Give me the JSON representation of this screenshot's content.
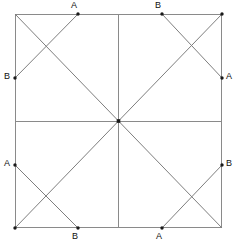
{
  "figure": {
    "name": "square-pinwheel-diagram",
    "type": "geometry-diagram",
    "canvas": {
      "width": 237,
      "height": 244
    },
    "square": {
      "left": 15,
      "top": 14,
      "right": 222,
      "bottom": 228,
      "width": 207,
      "height": 214,
      "stroke_color": "#8a8a8a"
    },
    "center": {
      "x": 118.5,
      "y": 121,
      "label": ""
    },
    "colors": {
      "background": "#ffffff",
      "square_stroke": "#8a8a8a",
      "median_stroke": "#8a8a8a",
      "diagonal_stroke": "#7e7e7e",
      "cross_stroke": "#7e7e7e",
      "dot_fill": "#1a1a1a",
      "label_text": "#101010"
    },
    "corners": [
      {
        "name": "top-left",
        "x": 15,
        "y": 14
      },
      {
        "name": "top-right",
        "x": 222,
        "y": 14
      },
      {
        "name": "bottom-right",
        "x": 222,
        "y": 228
      },
      {
        "name": "bottom-left",
        "x": 15,
        "y": 228
      }
    ],
    "medians": [
      {
        "name": "horizontal-median",
        "x1": 15,
        "y1": 121,
        "x2": 222,
        "y2": 121
      },
      {
        "name": "vertical-median",
        "x1": 118.5,
        "y1": 14,
        "x2": 118.5,
        "y2": 228
      }
    ],
    "diagonals": [
      {
        "name": "diagonal-center-to-top-left",
        "x1": 118.5,
        "y1": 121,
        "x2": 15,
        "y2": 14
      },
      {
        "name": "diagonal-center-to-top-right",
        "x1": 118.5,
        "y1": 121,
        "x2": 222,
        "y2": 14
      },
      {
        "name": "diagonal-center-to-bottom-right",
        "x1": 118.5,
        "y1": 121,
        "x2": 222,
        "y2": 228
      },
      {
        "name": "diagonal-center-to-bottom-left",
        "x1": 118.5,
        "y1": 121,
        "x2": 15,
        "y2": 228
      }
    ],
    "cross_segments": [
      {
        "name": "cross-top-left",
        "from": "top-A",
        "to": "left-B",
        "x1": 78,
        "y1": 14,
        "x2": 15,
        "y2": 78
      },
      {
        "name": "cross-top-right",
        "from": "top-B",
        "to": "right-A",
        "x1": 162,
        "y1": 14,
        "x2": 222,
        "y2": 78
      },
      {
        "name": "cross-bottom-left",
        "from": "left-A",
        "to": "bottom-B",
        "x1": 15,
        "y1": 165,
        "x2": 78,
        "y2": 228
      },
      {
        "name": "cross-bottom-right",
        "from": "right-B",
        "to": "bottom-A",
        "x1": 222,
        "y1": 165,
        "x2": 162,
        "y2": 228
      }
    ],
    "points": [
      {
        "id": "top-A",
        "label": "A",
        "x": 78,
        "y": 14,
        "label_x": 71,
        "label_y": 1,
        "edge": "top"
      },
      {
        "id": "top-B",
        "label": "B",
        "x": 162,
        "y": 14,
        "label_x": 155,
        "label_y": 1,
        "edge": "top"
      },
      {
        "id": "left-B",
        "label": "B",
        "x": 15,
        "y": 78,
        "label_x": 4,
        "label_y": 72,
        "edge": "left"
      },
      {
        "id": "right-A",
        "label": "A",
        "x": 222,
        "y": 78,
        "label_x": 226,
        "label_y": 72,
        "edge": "right"
      },
      {
        "id": "left-A",
        "label": "A",
        "x": 15,
        "y": 165,
        "label_x": 4,
        "label_y": 159,
        "edge": "left"
      },
      {
        "id": "right-B",
        "label": "B",
        "x": 222,
        "y": 165,
        "label_x": 226,
        "label_y": 159,
        "edge": "right"
      },
      {
        "id": "bottom-B",
        "label": "B",
        "x": 78,
        "y": 228,
        "label_x": 72,
        "label_y": 232,
        "edge": "bottom"
      },
      {
        "id": "bottom-A",
        "label": "A",
        "x": 162,
        "y": 228,
        "label_x": 156,
        "label_y": 232,
        "edge": "bottom"
      }
    ],
    "dots": [
      {
        "name": "dot-top-A",
        "x": 78,
        "y": 14,
        "r": 1.7
      },
      {
        "name": "dot-top-B",
        "x": 162,
        "y": 14,
        "r": 1.7
      },
      {
        "name": "dot-left-B",
        "x": 15,
        "y": 78,
        "r": 1.7
      },
      {
        "name": "dot-right-A",
        "x": 222,
        "y": 78,
        "r": 1.7
      },
      {
        "name": "dot-left-A",
        "x": 15,
        "y": 165,
        "r": 1.7
      },
      {
        "name": "dot-right-B",
        "x": 222,
        "y": 165,
        "r": 1.7
      },
      {
        "name": "dot-bottom-B",
        "x": 78,
        "y": 228,
        "r": 1.7
      },
      {
        "name": "dot-bottom-A",
        "x": 162,
        "y": 228,
        "r": 1.7
      },
      {
        "name": "dot-center",
        "x": 118.5,
        "y": 121,
        "r": 2.0
      },
      {
        "name": "dot-corner-top-right",
        "x": 222,
        "y": 14,
        "r": 1.7
      },
      {
        "name": "dot-corner-bottom-left",
        "x": 15,
        "y": 228,
        "r": 1.7
      }
    ]
  }
}
